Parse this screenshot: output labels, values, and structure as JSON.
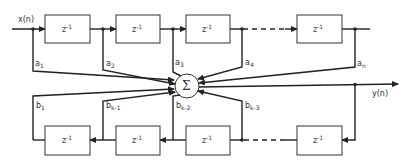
{
  "diagram": {
    "type": "block-diagram",
    "input_label": "x(n)",
    "output_label": "y(n)",
    "sum_symbol": "Σ",
    "forward_delays": [
      {
        "label": "z",
        "exp": "-1"
      },
      {
        "label": "z",
        "exp": "-1"
      },
      {
        "label": "z",
        "exp": "-1"
      },
      {
        "label": "z",
        "exp": "-1"
      }
    ],
    "feedback_delays": [
      {
        "label": "z",
        "exp": "-1"
      },
      {
        "label": "z",
        "exp": "-1"
      },
      {
        "label": "z",
        "exp": "-1"
      },
      {
        "label": "z",
        "exp": "-1"
      }
    ],
    "forward_coefficients": [
      {
        "base": "a",
        "sub": "1"
      },
      {
        "base": "a",
        "sub": "2"
      },
      {
        "base": "a",
        "sub": "3"
      },
      {
        "base": "a",
        "sub": "4"
      },
      {
        "base": "a",
        "sub": "n"
      }
    ],
    "feedback_coefficients": [
      {
        "base": "b",
        "sub": "1"
      },
      {
        "base": "b",
        "sub": "k-1"
      },
      {
        "base": "b",
        "sub": "k-2"
      },
      {
        "base": "b",
        "sub": "k-3"
      }
    ]
  }
}
